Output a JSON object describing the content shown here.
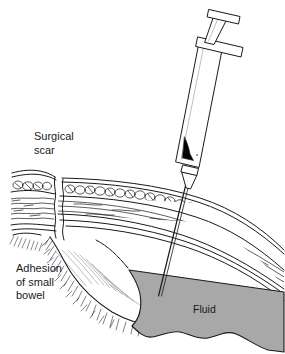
{
  "figure": {
    "type": "medical-illustration",
    "background_color": "#ffffff",
    "ink_color": "#1a1a1a"
  },
  "labels": {
    "surgical_scar": "Surgical\nscar",
    "adhesion": "Adhesion\nof small\nbowel",
    "fluid": "Fluid"
  },
  "colors": {
    "fluid_fill": "#a8a8a8",
    "fluid_stroke": "#1a1a1a",
    "tissue_fill": "#ffffff",
    "syringe_fill": "#ffffff",
    "plunger_seal": "#000000",
    "line": "#1a1a1a"
  },
  "parts": {
    "syringe_thumb_rest": "syringe-thumb-rest",
    "syringe_plunger_rod": "syringe-plunger-rod",
    "syringe_flange": "syringe-finger-flange",
    "syringe_barrel": "syringe-barrel",
    "syringe_aspirate": "syringe-aspirated-fluid",
    "syringe_collar": "syringe-collar",
    "syringe_hub": "syringe-needle-hub",
    "needle": "needle-shaft",
    "skin": "skin-layer",
    "fat": "subcutaneous-fat-layer",
    "muscle": "muscle-layer",
    "peritoneum": "peritoneum-layer",
    "scar_channel": "surgical-scar-channel",
    "adhesion_mass": "bowel-adhesion-mass",
    "fluid_pocket": "peritoneal-fluid-pocket"
  }
}
